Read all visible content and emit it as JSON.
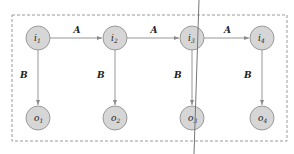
{
  "diagram": {
    "inputs": [
      {
        "id": "i1",
        "base": "i",
        "sub": "1"
      },
      {
        "id": "i2",
        "base": "i",
        "sub": "2"
      },
      {
        "id": "i3",
        "base": "i",
        "sub": "3"
      },
      {
        "id": "i4",
        "base": "i",
        "sub": "4"
      }
    ],
    "outputs": [
      {
        "id": "o1",
        "base": "o",
        "sub": "1"
      },
      {
        "id": "o2",
        "base": "o",
        "sub": "2"
      },
      {
        "id": "o3",
        "base": "o",
        "sub": "3"
      },
      {
        "id": "o4",
        "base": "o",
        "sub": "4"
      }
    ],
    "horizontal_edges": [
      {
        "from": "i1",
        "to": "i2",
        "label": "A"
      },
      {
        "from": "i2",
        "to": "i3",
        "label": "A"
      },
      {
        "from": "i3",
        "to": "i4",
        "label": "A"
      }
    ],
    "vertical_edges": [
      {
        "from": "i1",
        "to": "o1",
        "label": "B"
      },
      {
        "from": "i2",
        "to": "o2",
        "label": "B"
      },
      {
        "from": "i3",
        "to": "o3",
        "label": "B"
      },
      {
        "from": "i4",
        "to": "o4",
        "label": "B"
      }
    ],
    "colors": {
      "node_fill": "#d6d6d6",
      "node_stroke": "#9a9a9a",
      "edge": "#8a8a8a"
    }
  }
}
